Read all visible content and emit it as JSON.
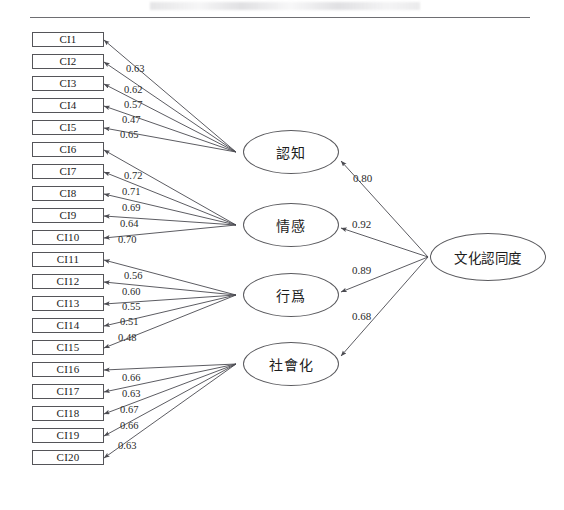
{
  "figure": {
    "type": "sem-path-diagram",
    "header_note": "",
    "indicators": [
      {
        "id": "CI1",
        "label": "CI1"
      },
      {
        "id": "CI2",
        "label": "CI2"
      },
      {
        "id": "CI3",
        "label": "CI3"
      },
      {
        "id": "CI4",
        "label": "CI4"
      },
      {
        "id": "CI5",
        "label": "CI5"
      },
      {
        "id": "CI6",
        "label": "CI6"
      },
      {
        "id": "CI7",
        "label": "CI7"
      },
      {
        "id": "CI8",
        "label": "CI8"
      },
      {
        "id": "CI9",
        "label": "CI9"
      },
      {
        "id": "CI10",
        "label": "CI10"
      },
      {
        "id": "CI11",
        "label": "CI11"
      },
      {
        "id": "CI12",
        "label": "CI12"
      },
      {
        "id": "CI13",
        "label": "CI13"
      },
      {
        "id": "CI14",
        "label": "CI14"
      },
      {
        "id": "CI15",
        "label": "CI15"
      },
      {
        "id": "CI16",
        "label": "CI16"
      },
      {
        "id": "CI17",
        "label": "CI17"
      },
      {
        "id": "CI18",
        "label": "CI18"
      },
      {
        "id": "CI19",
        "label": "CI19"
      },
      {
        "id": "CI20",
        "label": "CI20"
      }
    ],
    "factors": [
      {
        "id": "cognition",
        "label": "認知"
      },
      {
        "id": "affect",
        "label": "情感"
      },
      {
        "id": "behavior",
        "label": "行爲"
      },
      {
        "id": "socialization",
        "label": "社會化"
      }
    ],
    "second_order": {
      "id": "cultural-identity",
      "label": "文化認同度"
    },
    "loadings": [
      {
        "factor": "cognition",
        "indicator": "CI1",
        "value": "0.63"
      },
      {
        "factor": "cognition",
        "indicator": "CI2",
        "value": "0.62"
      },
      {
        "factor": "cognition",
        "indicator": "CI3",
        "value": "0.57"
      },
      {
        "factor": "cognition",
        "indicator": "CI4",
        "value": "0.47"
      },
      {
        "factor": "cognition",
        "indicator": "CI5",
        "value": "0.65"
      },
      {
        "factor": "affect",
        "indicator": "CI6",
        "value": "0.72"
      },
      {
        "factor": "affect",
        "indicator": "CI7",
        "value": "0.71"
      },
      {
        "factor": "affect",
        "indicator": "CI8",
        "value": "0.69"
      },
      {
        "factor": "affect",
        "indicator": "CI9",
        "value": "0.64"
      },
      {
        "factor": "affect",
        "indicator": "CI10",
        "value": "0.70"
      },
      {
        "factor": "behavior",
        "indicator": "CI11",
        "value": "0.56"
      },
      {
        "factor": "behavior",
        "indicator": "CI12",
        "value": "0.60"
      },
      {
        "factor": "behavior",
        "indicator": "CI13",
        "value": "0.55"
      },
      {
        "factor": "behavior",
        "indicator": "CI14",
        "value": "0.51"
      },
      {
        "factor": "behavior",
        "indicator": "CI15",
        "value": "0.48"
      },
      {
        "factor": "socialization",
        "indicator": "CI16",
        "value": "0.66"
      },
      {
        "factor": "socialization",
        "indicator": "CI17",
        "value": "0.63"
      },
      {
        "factor": "socialization",
        "indicator": "CI18",
        "value": "0.67"
      },
      {
        "factor": "socialization",
        "indicator": "CI19",
        "value": "0.66"
      },
      {
        "factor": "socialization",
        "indicator": "CI20",
        "value": "0.63"
      }
    ],
    "structural_paths": [
      {
        "from": "cultural-identity",
        "to": "cognition",
        "value": "0.80"
      },
      {
        "from": "cultural-identity",
        "to": "affect",
        "value": "0.92"
      },
      {
        "from": "cultural-identity",
        "to": "behavior",
        "value": "0.89"
      },
      {
        "from": "cultural-identity",
        "to": "socialization",
        "value": "0.68"
      }
    ],
    "colors": {
      "box_stroke": "#555559",
      "ellipse_stroke": "#5a5a5e",
      "arrow": "#4a4a50",
      "text": "#1c1c1c",
      "rule": "#6e6e72"
    }
  }
}
